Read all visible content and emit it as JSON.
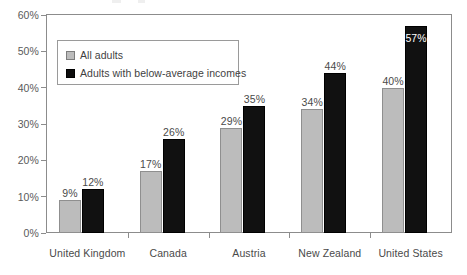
{
  "chart_data": {
    "type": "bar",
    "title": "",
    "subtitle": "",
    "xlabel": "",
    "ylabel": "",
    "categories": [
      "United Kingdom",
      "Canada",
      "Austria",
      "New Zealand",
      "United States"
    ],
    "series": [
      {
        "name": "All adults",
        "color": "#bcbcbc",
        "values": [
          9,
          17,
          29,
          34,
          40
        ],
        "labels": [
          "9%",
          "17%",
          "29%",
          "34%",
          "40%"
        ],
        "label_position": [
          "outside",
          "outside",
          "outside",
          "outside",
          "outside"
        ]
      },
      {
        "name": "Adults with below-average incomes",
        "color": "#111111",
        "values": [
          12,
          26,
          35,
          44,
          57
        ],
        "labels": [
          "12%",
          "26%",
          "35%",
          "44%",
          "57%"
        ],
        "label_position": [
          "outside",
          "outside",
          "outside",
          "outside",
          "inside"
        ]
      }
    ],
    "ylim": [
      0,
      60
    ],
    "ytick_values": [
      0,
      10,
      20,
      30,
      40,
      50,
      60
    ],
    "ytick_labels": [
      "0%",
      "10%",
      "20%",
      "30%",
      "40%",
      "50%",
      "60%"
    ],
    "grid": false,
    "legend_position": "top-left-inside",
    "value_unit": "%"
  },
  "legend": {
    "entries": [
      {
        "label": "All adults",
        "swatch": "gray-square-swatch"
      },
      {
        "label": "Adults with below-average incomes",
        "swatch": "black-square-swatch"
      }
    ]
  },
  "axis": {
    "y_ticks": [
      "60%",
      "50%",
      "40%",
      "30%",
      "20%",
      "10%",
      "0%"
    ],
    "x_labels": [
      "United Kingdom",
      "Canada",
      "Austria",
      "New Zealand",
      "United States"
    ]
  }
}
